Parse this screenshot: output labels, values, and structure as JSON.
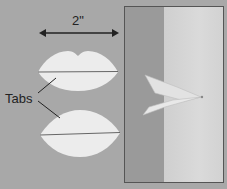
{
  "figure": {
    "dimension_label": "2\"",
    "callout_label": "Tabs",
    "colors": {
      "background": "#a8a8a8",
      "paper": "#ececec",
      "photo_dark": "#9a9a9a",
      "photo_light": "#d4d4d4",
      "lines": "#333333"
    }
  }
}
